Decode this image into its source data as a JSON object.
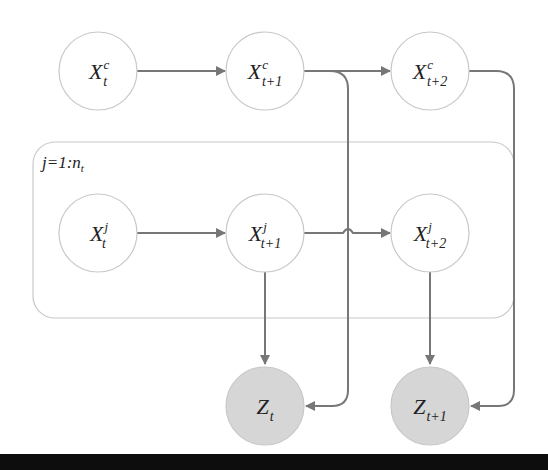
{
  "diagram": {
    "type": "dynamic bayesian network / plate diagram",
    "colors": {
      "edge": "#777777",
      "node_border": "#c8c8c8",
      "observed_fill": "#d6d6d6",
      "plate_border": "#c8c8c8",
      "bottom_bar": "#0d0d0d"
    },
    "plate": {
      "label_main": "j=1:n",
      "label_sub": "t"
    },
    "nodes": [
      {
        "id": "xc_t",
        "base": "X",
        "sup": "c",
        "sub": "t",
        "observed": false
      },
      {
        "id": "xc_t1",
        "base": "X",
        "sup": "c",
        "sub": "t+1",
        "observed": false
      },
      {
        "id": "xc_t2",
        "base": "X",
        "sup": "c",
        "sub": "t+2",
        "observed": false
      },
      {
        "id": "xj_t",
        "base": "X",
        "sup": "j",
        "sub": "t",
        "observed": false
      },
      {
        "id": "xj_t1",
        "base": "X",
        "sup": "j",
        "sub": "t+1",
        "observed": false
      },
      {
        "id": "xj_t2",
        "base": "X",
        "sup": "j",
        "sub": "t+2",
        "observed": false
      },
      {
        "id": "z_t",
        "base": "Z",
        "sup": "",
        "sub": "t",
        "observed": true
      },
      {
        "id": "z_t1",
        "base": "Z",
        "sup": "",
        "sub": "t+1",
        "observed": true
      }
    ],
    "edges": [
      {
        "from": "xc_t",
        "to": "xc_t1"
      },
      {
        "from": "xc_t1",
        "to": "xc_t2"
      },
      {
        "from": "xc_t1",
        "to": "z_t"
      },
      {
        "from": "xc_t2",
        "to": "z_t1"
      },
      {
        "from": "xj_t",
        "to": "xj_t1"
      },
      {
        "from": "xj_t1",
        "to": "xj_t2"
      },
      {
        "from": "xj_t1",
        "to": "z_t"
      },
      {
        "from": "xj_t2",
        "to": "z_t1"
      }
    ]
  }
}
